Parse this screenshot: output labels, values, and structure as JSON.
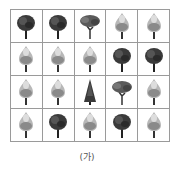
{
  "figure": {
    "caption": "(가)",
    "rows": 4,
    "cols": 5,
    "cells": [
      [
        "dark-round",
        "dark-round",
        "spreading",
        "light-flame",
        "light-flame"
      ],
      [
        "light-flame",
        "light-flame",
        "light-flame",
        "dark-round",
        "dark-round"
      ],
      [
        "light-flame",
        "light-flame",
        "conifer",
        "spreading",
        "light-flame"
      ],
      [
        "light-flame",
        "dark-round",
        "light-flame",
        "dark-round",
        "light-flame"
      ]
    ]
  }
}
